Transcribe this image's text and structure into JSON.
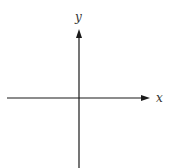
{
  "diagram": {
    "type": "coordinate-axes",
    "x_axis": {
      "label": "x",
      "direction": "right"
    },
    "y_axis": {
      "label": "y",
      "direction": "up"
    },
    "colors": {
      "axis": "#1a1a1a",
      "label": "#333333",
      "background": "#ffffff"
    }
  }
}
